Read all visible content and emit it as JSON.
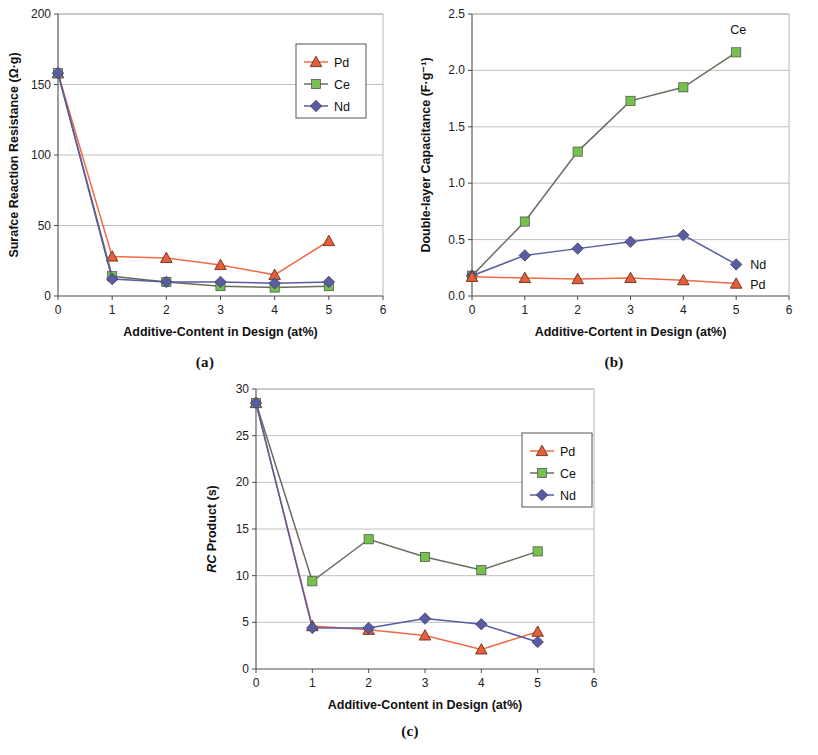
{
  "figure": {
    "panels": [
      {
        "id": "a",
        "caption": "(a)",
        "xlabel": "Additive-Content in Design (at%)",
        "ylabel": "Surafce Reaction Resistance (Ω·g)",
        "legend_position": "inside-top-right",
        "label_style": "legend-box"
      },
      {
        "id": "b",
        "caption": "(b)",
        "xlabel": "Additive-Cortent in Design (at%)",
        "ylabel": "Double-layer Capacitance (F·g⁻¹)",
        "legend_position": "inline",
        "label_style": "inline"
      },
      {
        "id": "c",
        "caption": "(c)",
        "xlabel": "Additive-Content in Design (at%)",
        "ylabel": "RC Product (s)",
        "ylabel_italic_prefix": "RC",
        "ylabel_rest": " Product (s)",
        "legend_position": "inside-top-right",
        "label_style": "legend-box"
      }
    ]
  },
  "colors": {
    "pd_marker": "#E2603C",
    "pd_line": "#EE6B45",
    "ce_marker": "#76C14E",
    "ce_line": "#6B6B5E",
    "nd_marker": "#5A5CA0",
    "nd_line": "#5A5CA0",
    "axis": "#4d4d4d",
    "grid": "#b0b0b0",
    "text": "#111111",
    "legend_border": "#555555"
  },
  "chart_data": [
    {
      "type": "line",
      "panel": "a",
      "title": "",
      "xlabel": "Additive-Content in Design (at%)",
      "ylabel": "Surafce Reaction Resistance (Ω·g)",
      "x": [
        0,
        1,
        2,
        3,
        4,
        5
      ],
      "xlim": [
        0,
        6
      ],
      "ylim": [
        0,
        200
      ],
      "xticks": [
        0,
        1,
        2,
        3,
        4,
        5,
        6
      ],
      "yticks": [
        0,
        50,
        100,
        150,
        200
      ],
      "xtick_labels": [
        "0",
        "1",
        "2",
        "3",
        "4",
        "5",
        "6"
      ],
      "ytick_labels": [
        "0",
        "50",
        "100",
        "150",
        "200"
      ],
      "grid": true,
      "legend": [
        "Pd",
        "Ce",
        "Nd"
      ],
      "legend_position": "upper right",
      "series": [
        {
          "name": "Pd",
          "marker": "triangle",
          "values": [
            158,
            28,
            27,
            22,
            15,
            39
          ]
        },
        {
          "name": "Ce",
          "marker": "square",
          "values": [
            158,
            14,
            10,
            7,
            6,
            7
          ]
        },
        {
          "name": "Nd",
          "marker": "diamond",
          "values": [
            158,
            12,
            10,
            10,
            9,
            10
          ]
        }
      ]
    },
    {
      "type": "line",
      "panel": "b",
      "title": "",
      "xlabel": "Additive-Cortent in Design (at%)",
      "ylabel": "Double-layer Capacitance (F·g⁻¹)",
      "x": [
        0,
        1,
        2,
        3,
        4,
        5
      ],
      "xlim": [
        0,
        6
      ],
      "ylim": [
        0,
        2.5
      ],
      "xticks": [
        0,
        1,
        2,
        3,
        4,
        5,
        6
      ],
      "yticks": [
        0,
        0.5,
        1.0,
        1.5,
        2.0,
        2.5
      ],
      "xtick_labels": [
        "0",
        "1",
        "2",
        "3",
        "4",
        "5",
        "6"
      ],
      "ytick_labels": [
        "0.0",
        "0.5",
        "1.0",
        "1.5",
        "2.0",
        "2.5"
      ],
      "grid": true,
      "legend": [
        "Ce",
        "Nd",
        "Pd"
      ],
      "legend_position": "inline-right",
      "series": [
        {
          "name": "Ce",
          "marker": "square",
          "values": [
            0.18,
            0.66,
            1.28,
            1.73,
            1.85,
            2.16
          ],
          "inline_label": "Ce",
          "inline_label_at": 5
        },
        {
          "name": "Nd",
          "marker": "diamond",
          "values": [
            0.18,
            0.36,
            0.42,
            0.48,
            0.54,
            0.28
          ],
          "inline_label": "Nd",
          "inline_label_at": 5
        },
        {
          "name": "Pd",
          "marker": "triangle",
          "values": [
            0.17,
            0.16,
            0.15,
            0.16,
            0.14,
            0.11
          ],
          "inline_label": "Pd",
          "inline_label_at": 5
        }
      ]
    },
    {
      "type": "line",
      "panel": "c",
      "title": "",
      "xlabel": "Additive-Content in Design (at%)",
      "ylabel": "RC Product (s)",
      "x": [
        0,
        1,
        2,
        3,
        4,
        5
      ],
      "xlim": [
        0,
        6
      ],
      "ylim": [
        0,
        30
      ],
      "xticks": [
        0,
        1,
        2,
        3,
        4,
        5,
        6
      ],
      "yticks": [
        0,
        5,
        10,
        15,
        20,
        25,
        30
      ],
      "xtick_labels": [
        "0",
        "1",
        "2",
        "3",
        "4",
        "5",
        "6"
      ],
      "ytick_labels": [
        "0",
        "5",
        "10",
        "15",
        "20",
        "25",
        "30"
      ],
      "grid": true,
      "legend": [
        "Pd",
        "Ce",
        "Nd"
      ],
      "legend_position": "upper right",
      "series": [
        {
          "name": "Pd",
          "marker": "triangle",
          "values": [
            28.5,
            4.6,
            4.2,
            3.6,
            2.1,
            4.0
          ]
        },
        {
          "name": "Ce",
          "marker": "square",
          "values": [
            28.5,
            9.4,
            13.9,
            12.0,
            10.6,
            12.6
          ]
        },
        {
          "name": "Nd",
          "marker": "diamond",
          "values": [
            28.5,
            4.4,
            4.4,
            5.4,
            4.8,
            2.9
          ]
        }
      ]
    }
  ]
}
